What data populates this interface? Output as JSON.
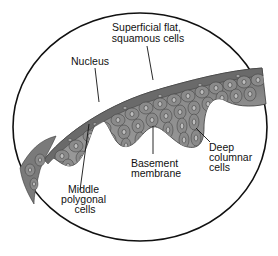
{
  "diagram": {
    "frame": {
      "shape": "ellipse",
      "stroke": "#111111",
      "fill": "#ffffff"
    },
    "tissue": {
      "fill": "#7d7d7d",
      "edge": "#3a3a3a",
      "highlight": "#a9a9a9"
    },
    "labels": {
      "superficial": {
        "line1": "Superficial flat,",
        "line2": "squamous cells"
      },
      "nucleus": {
        "text": "Nucleus"
      },
      "basement": {
        "line1": "Basement",
        "line2": "membrane"
      },
      "deep": {
        "line1": "Deep",
        "line2": "columnar",
        "line3": "cells"
      },
      "middle": {
        "line1": "Middle",
        "line2": "polygonal",
        "line3": "cells"
      }
    }
  }
}
